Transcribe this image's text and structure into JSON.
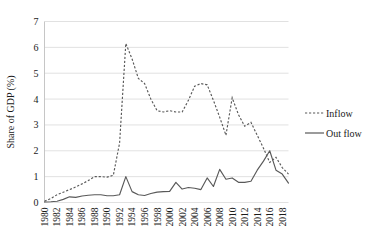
{
  "chart_data": {
    "type": "line",
    "title": "",
    "subtitle": "",
    "xlabel": "",
    "ylabel": "Share of GDP (%)",
    "ylim": [
      0,
      7
    ],
    "yticks": [
      0,
      1,
      2,
      3,
      4,
      5,
      6,
      7
    ],
    "grid": true,
    "legend_position": "right",
    "x": [
      1980,
      1981,
      1982,
      1983,
      1984,
      1985,
      1986,
      1987,
      1988,
      1989,
      1990,
      1991,
      1992,
      1993,
      1994,
      1995,
      1996,
      1997,
      1998,
      1999,
      2000,
      2001,
      2002,
      2003,
      2004,
      2005,
      2006,
      2007,
      2008,
      2009,
      2010,
      2011,
      2012,
      2013,
      2014,
      2015,
      2016,
      2017,
      2018,
      2019
    ],
    "xtick_labels": [
      "1980",
      "1982",
      "1984",
      "1986",
      "1988",
      "1990",
      "1992",
      "1994",
      "1996",
      "1998",
      "2000",
      "2002",
      "2004",
      "2006",
      "2008",
      "2010",
      "2012",
      "2014",
      "2016",
      "2018"
    ],
    "series": [
      {
        "name": "Inflow",
        "style": "dashed",
        "color": "#595959",
        "values": [
          0.05,
          0.15,
          0.3,
          0.4,
          0.5,
          0.6,
          0.72,
          0.85,
          1.0,
          1.0,
          0.98,
          1.05,
          2.3,
          6.15,
          5.55,
          4.8,
          4.6,
          4.0,
          3.55,
          3.5,
          3.55,
          3.5,
          3.5,
          3.95,
          4.5,
          4.6,
          4.55,
          3.95,
          3.3,
          2.6,
          4.05,
          3.4,
          2.95,
          3.1,
          2.6,
          2.1,
          1.55,
          1.75,
          1.35,
          1.1
        ]
      },
      {
        "name": "Out flow",
        "style": "solid",
        "color": "#595959",
        "values": [
          0.02,
          0.03,
          0.05,
          0.12,
          0.22,
          0.2,
          0.25,
          0.28,
          0.3,
          0.3,
          0.26,
          0.26,
          0.3,
          1.0,
          0.42,
          0.3,
          0.27,
          0.35,
          0.4,
          0.42,
          0.43,
          0.78,
          0.52,
          0.58,
          0.55,
          0.5,
          0.95,
          0.62,
          1.28,
          0.9,
          0.95,
          0.78,
          0.78,
          0.82,
          1.25,
          1.6,
          2.0,
          1.25,
          1.1,
          0.75
        ]
      }
    ]
  },
  "axis": {
    "y_title": "Share of GDP (%)"
  },
  "legend": {
    "items": [
      {
        "label": "Inflow",
        "style": "dashed"
      },
      {
        "label": "Out flow",
        "style": "solid"
      }
    ]
  },
  "colors": {
    "line": "#595959",
    "grid": "#d9d9d9",
    "text": "#1a1a1a",
    "background": "#ffffff"
  }
}
